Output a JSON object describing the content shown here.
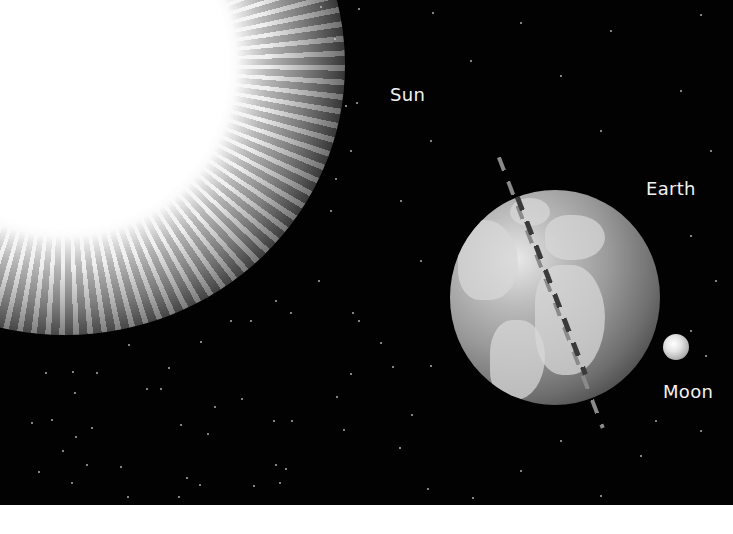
{
  "diagram": {
    "labels": {
      "sun": "Sun",
      "earth": "Earth",
      "moon": "Moon"
    },
    "colors": {
      "space_background": "#020202",
      "label_text": "#f2f2f2",
      "page_background": "#ffffff"
    }
  }
}
